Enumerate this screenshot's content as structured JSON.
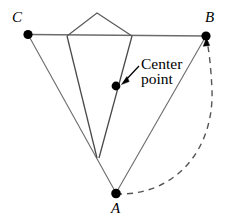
{
  "figure": {
    "background_color": "#ffffff",
    "line_color": "#595959",
    "dark_line_color": "#4a4a4a",
    "dot_color": "#000000",
    "text_color": "#000000",
    "width": 230,
    "height": 221
  },
  "vertices": {
    "A": {
      "label": "A",
      "x": 116,
      "y": 193,
      "label_x": 111,
      "label_y": 202
    },
    "B": {
      "label": "B",
      "x": 206,
      "y": 36,
      "label_x": 206,
      "label_y": 12
    },
    "C": {
      "label": "C",
      "x": 28,
      "y": 34,
      "label_x": 12,
      "label_y": 12
    },
    "center_point": {
      "x": 116,
      "y": 86
    }
  },
  "annotation": {
    "line1": "Center",
    "line2": "point",
    "x": 141,
    "y": 58
  },
  "cone": {
    "apex_x": 97,
    "apex_y": 13,
    "left_top_x": 67,
    "left_top_y": 36,
    "right_top_x": 132,
    "right_top_y": 36,
    "converge_x": 97,
    "converge_y": 158
  },
  "segments": [
    {
      "name": "segment-C-B",
      "from": "C",
      "to": "B"
    },
    {
      "name": "segment-C-A",
      "from": "C",
      "to": "A"
    },
    {
      "name": "segment-A-B",
      "from": "A",
      "to": "B"
    }
  ],
  "arc": {
    "name": "dashed-arc-A-to-B",
    "style": "dashed",
    "dash_pattern": "6 5",
    "from": "A",
    "to": "B",
    "arrowhead_at": "B"
  }
}
